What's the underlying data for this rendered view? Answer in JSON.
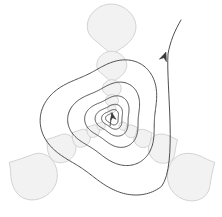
{
  "figure": {
    "title": "Self-similar logarithmic spiral with three-fold lobed symmetry",
    "background_color": "#ffffff",
    "width": 222,
    "height": 217,
    "center": {
      "x": 112,
      "y": 118
    }
  },
  "style": {
    "spiral_stroke_color": "#3a3a3a",
    "spiral_stroke_width": 0.9,
    "blob_fill_color": "#f2f2f2",
    "blob_stroke_color": "#c9c9c9",
    "blob_stroke_width": 0.8,
    "arrow_color": "#3a3a3a"
  },
  "chart_data": {
    "type": "line",
    "title": "Self-similar logarithmic spiral with three-fold lobed symmetry",
    "xlabel": "",
    "ylabel": "",
    "grid": false,
    "legend": "none",
    "xlim": [
      0,
      222
    ],
    "ylim": [
      0,
      217
    ],
    "spiral": {
      "kind": "logarithmic-spiral-with-3-fold-lobes",
      "center": {
        "x": 112,
        "y": 118
      },
      "turns": 5.6,
      "growth_factor_per_turn": 1.62,
      "start_radius": 5,
      "end_radius": 104,
      "lobe_count": 3,
      "lobe_amplitude": 0.14,
      "lobe_phase_deg": 90,
      "direction": "counterclockwise-outward"
    },
    "series": [
      {
        "name": "spiral-curve",
        "color": "#3a3a3a",
        "points_note": "parametric r(t)=r0*exp(b*t)*(1+a*cos(3t+phase))"
      }
    ],
    "annotations": [
      {
        "name": "center-arrowhead",
        "x": 112,
        "y": 113,
        "angle_deg": -100,
        "size": 7,
        "note": "small arrowhead at spiral core pointing inward"
      },
      {
        "name": "tail-arrowhead",
        "x": 166,
        "y": 52,
        "angle_deg": -70,
        "size": 9,
        "note": "arrowhead on outer tail pointing outward to upper right"
      }
    ],
    "blob_scales": [
      {
        "level": 0,
        "radius": 96,
        "blob_size": 26,
        "count": 3
      },
      {
        "level": 1,
        "radius": 59,
        "blob_size": 16,
        "count": 3
      },
      {
        "level": 2,
        "radius": 36,
        "blob_size": 10,
        "count": 3
      },
      {
        "level": 3,
        "radius": 22,
        "blob_size": 7,
        "count": 3
      },
      {
        "level": 4,
        "radius": 13,
        "blob_size": 4.5,
        "count": 3
      }
    ],
    "blobs": [
      {
        "name": "blob-outer-top",
        "cx": 112,
        "cy": 28,
        "size": 26,
        "angle_deg": 90,
        "level": 0
      },
      {
        "name": "blob-outer-bottom-left",
        "cx": 33,
        "cy": 176,
        "size": 26,
        "angle_deg": 210,
        "level": 0
      },
      {
        "name": "blob-outer-bottom-right",
        "cx": 191,
        "cy": 176,
        "size": 26,
        "angle_deg": 330,
        "level": 0
      },
      {
        "name": "blob-mid-top",
        "cx": 112,
        "cy": 66,
        "size": 16,
        "angle_deg": 90,
        "level": 1
      },
      {
        "name": "blob-mid-bottom-left",
        "cx": 61,
        "cy": 148,
        "size": 16,
        "angle_deg": 210,
        "level": 1
      },
      {
        "name": "blob-mid-bottom-right",
        "cx": 163,
        "cy": 148,
        "size": 16,
        "angle_deg": 330,
        "level": 1
      },
      {
        "name": "blob-mid2-top",
        "cx": 112,
        "cy": 89,
        "size": 10,
        "angle_deg": 90,
        "level": 2
      },
      {
        "name": "blob-mid2-bottom-left",
        "cx": 81,
        "cy": 138,
        "size": 10,
        "angle_deg": 210,
        "level": 2
      },
      {
        "name": "blob-mid2-bottom-right",
        "cx": 143,
        "cy": 138,
        "size": 10,
        "angle_deg": 330,
        "level": 2
      },
      {
        "name": "blob-inner-top",
        "cx": 112,
        "cy": 101,
        "size": 7,
        "angle_deg": 90,
        "level": 3
      },
      {
        "name": "blob-inner-bottom-left",
        "cx": 93,
        "cy": 131,
        "size": 7,
        "angle_deg": 210,
        "level": 3
      },
      {
        "name": "blob-inner-bottom-right",
        "cx": 131,
        "cy": 131,
        "size": 7,
        "angle_deg": 330,
        "level": 3
      },
      {
        "name": "blob-core-top",
        "cx": 112,
        "cy": 109,
        "size": 4.5,
        "angle_deg": 90,
        "level": 4
      },
      {
        "name": "blob-core-bottom-left",
        "cx": 101,
        "cy": 126,
        "size": 4.5,
        "angle_deg": 210,
        "level": 4
      },
      {
        "name": "blob-core-bottom-right",
        "cx": 123,
        "cy": 126,
        "size": 4.5,
        "angle_deg": 330,
        "level": 4
      }
    ]
  }
}
